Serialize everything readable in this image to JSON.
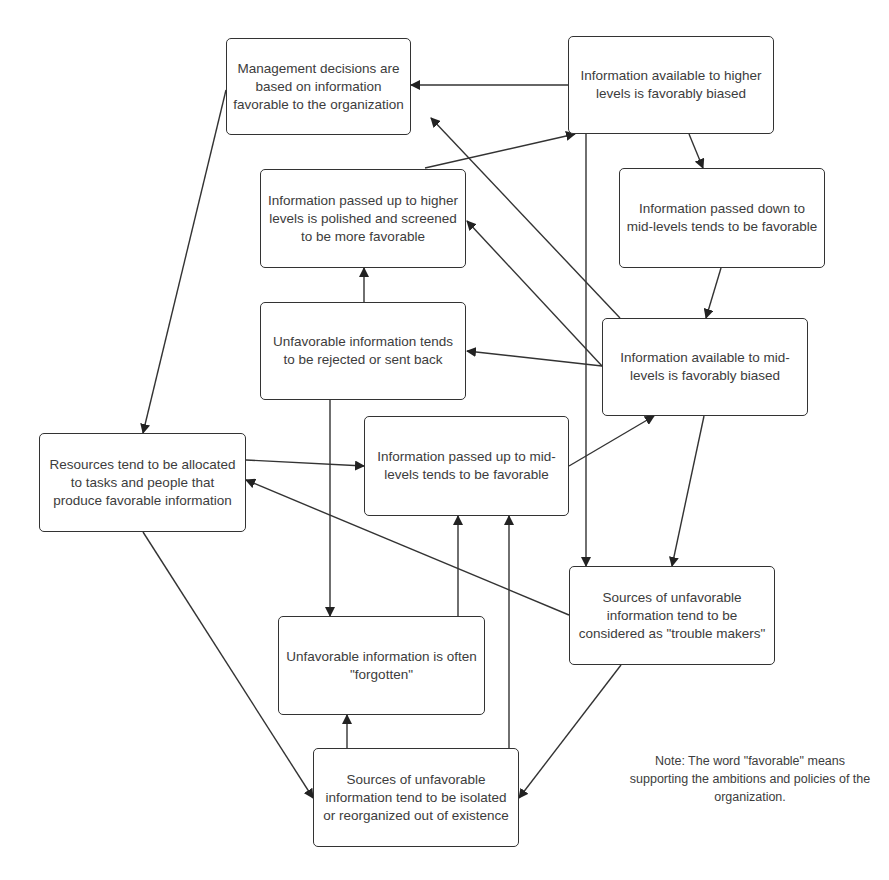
{
  "nodes": {
    "management": "Management decisions are based on information favorable to the organization",
    "higher_biased": "Information available to higher levels is favorably biased",
    "polished": "Information passed up to higher levels is polished and screened to be more favorable",
    "passed_down": "Information passed down to mid-levels tends to be favorable",
    "rejected": "Unfavorable information tends to be rejected or sent back",
    "mid_biased": "Information available to mid-levels is favorably biased",
    "resources": "Resources tend to be allocated to tasks and people that produce favorable information",
    "mid_passed_up": "Information passed up to mid-levels tends to be favorable",
    "trouble_makers": "Sources of unfavorable information tend to be considered as \"trouble makers\"",
    "forgotten": "Unfavorable information is often \"forgotten\"",
    "isolated": "Sources of unfavorable information tend to be isolated or reorganized out of existence"
  },
  "note": "Note: The word \"favorable\" means supporting the ambitions and policies of the organization.",
  "edges": [
    {
      "from": "higher_biased",
      "to": "management"
    },
    {
      "from": "higher_biased",
      "to": "passed_down"
    },
    {
      "from": "higher_biased",
      "to": "trouble_makers"
    },
    {
      "from": "management",
      "to": "resources"
    },
    {
      "from": "polished",
      "to": "higher_biased"
    },
    {
      "from": "rejected",
      "to": "polished"
    },
    {
      "from": "rejected",
      "to": "forgotten"
    },
    {
      "from": "passed_down",
      "to": "mid_biased"
    },
    {
      "from": "mid_biased",
      "to": "management"
    },
    {
      "from": "mid_biased",
      "to": "polished"
    },
    {
      "from": "mid_biased",
      "to": "rejected"
    },
    {
      "from": "mid_biased",
      "to": "trouble_makers"
    },
    {
      "from": "resources",
      "to": "mid_passed_up"
    },
    {
      "from": "resources",
      "to": "isolated"
    },
    {
      "from": "mid_passed_up",
      "to": "mid_biased"
    },
    {
      "from": "trouble_makers",
      "to": "resources"
    },
    {
      "from": "trouble_makers",
      "to": "isolated"
    },
    {
      "from": "forgotten",
      "to": "mid_passed_up"
    },
    {
      "from": "isolated",
      "to": "mid_passed_up"
    },
    {
      "from": "isolated",
      "to": "forgotten"
    }
  ]
}
